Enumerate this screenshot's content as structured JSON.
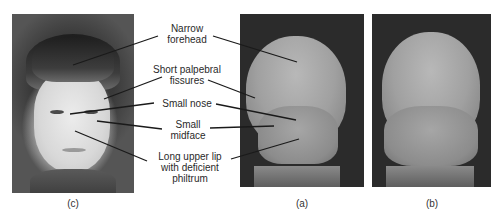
{
  "figure": {
    "panels": [
      {
        "id": "c",
        "caption": "(c)",
        "description": "Photograph of child's face"
      },
      {
        "id": "a",
        "caption": "(a)",
        "description": "SEM of affected embryo face"
      },
      {
        "id": "b",
        "caption": "(b)",
        "description": "SEM of normal embryo face"
      }
    ],
    "labels": [
      {
        "line1": "Narrow",
        "line2": "forehead",
        "line3": ""
      },
      {
        "line1": "Short palpebral",
        "line2": "fissures",
        "line3": ""
      },
      {
        "line1": "Small nose",
        "line2": "",
        "line3": ""
      },
      {
        "line1": "Small",
        "line2": "midface",
        "line3": ""
      },
      {
        "line1": "Long upper lip",
        "line2": "with deficient",
        "line3": "philtrum"
      }
    ],
    "colors": {
      "background": "#ffffff",
      "text": "#2a2a2a",
      "leader_line": "#1a1a1a",
      "sem_background": "#2b2b2b"
    }
  }
}
